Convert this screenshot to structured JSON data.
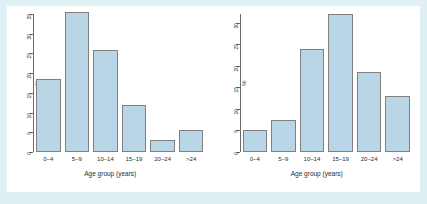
{
  "figure": {
    "background_color": "#dff0f5",
    "panel_color": "#ffffff",
    "bar_fill_color": "#b9d6e6",
    "bar_border_color": "#808080",
    "axis_color": "#6b6b6b"
  },
  "chart_data": [
    {
      "type": "bar",
      "panel": "left",
      "title": "",
      "xlabel": "Age group (years)",
      "ylabel": "%",
      "categories": [
        "0–4",
        "5–9",
        "10–14",
        "15–19",
        "20–24",
        ">24"
      ],
      "values": [
        18.5,
        35.5,
        26,
        12,
        3,
        5.5
      ],
      "ylim": [
        0,
        35
      ],
      "yticks": [
        0,
        5,
        10,
        15,
        20,
        25,
        30,
        35
      ],
      "ytick_labels": [
        "0",
        "5",
        "10",
        "15",
        "20",
        "25",
        "30",
        "35"
      ],
      "grid": false,
      "legend": false
    },
    {
      "type": "bar",
      "panel": "right",
      "title": "",
      "xlabel": "Age group (years)",
      "ylabel": "%",
      "categories": [
        "0–4",
        "5–9",
        "10–14",
        "15–19",
        "20–24",
        ">24"
      ],
      "values": [
        5,
        7.5,
        24,
        32,
        18.5,
        13
      ],
      "ylim": [
        0,
        32
      ],
      "yticks": [
        0,
        5,
        10,
        15,
        20,
        25,
        30
      ],
      "ytick_labels": [
        "0",
        "5",
        "10",
        "15",
        "20",
        "25",
        "30"
      ],
      "grid": false,
      "legend": false
    }
  ]
}
